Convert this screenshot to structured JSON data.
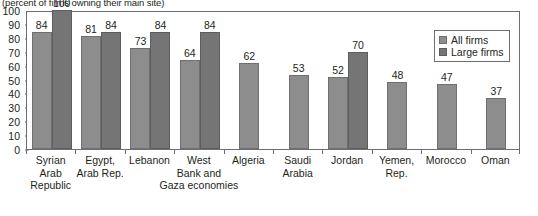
{
  "subtitle": "(percent of firms owning their main site)",
  "legend": {
    "position": "top-right",
    "entries": [
      {
        "label": "All firms",
        "color": "#8d8d8d"
      },
      {
        "label": "Large firms",
        "color": "#757575"
      }
    ]
  },
  "yaxis": {
    "ticks": [
      "0",
      "10",
      "20",
      "30",
      "40",
      "50",
      "60",
      "70",
      "80",
      "90",
      "100"
    ]
  },
  "categories": [
    {
      "lines": [
        "Syrian",
        "Arab",
        "Republic"
      ]
    },
    {
      "lines": [
        "Egypt,",
        "Arab Rep."
      ]
    },
    {
      "lines": [
        "Lebanon"
      ]
    },
    {
      "lines": [
        "West",
        "Bank and",
        "Gaza economies"
      ]
    },
    {
      "lines": [
        "Algeria"
      ]
    },
    {
      "lines": [
        "Saudi",
        "Arabia"
      ]
    },
    {
      "lines": [
        "Jordan"
      ]
    },
    {
      "lines": [
        "Yemen,",
        "Rep."
      ]
    },
    {
      "lines": [
        "Morocco"
      ]
    },
    {
      "lines": [
        "Oman"
      ]
    }
  ],
  "chart_data": {
    "type": "bar",
    "title": "",
    "subtitle": "(percent of firms owning their main site)",
    "xlabel": "",
    "ylabel": "",
    "ylim": [
      0,
      100
    ],
    "ytick_step": 10,
    "grid": false,
    "legend_position": "top-right",
    "categories": [
      "Syrian Arab Republic",
      "Egypt, Arab Rep.",
      "Lebanon",
      "West Bank and Gaza economies",
      "Algeria",
      "Saudi Arabia",
      "Jordan",
      "Yemen, Rep.",
      "Morocco",
      "Oman"
    ],
    "series": [
      {
        "name": "All firms",
        "color": "#8d8d8d",
        "values": [
          84,
          81,
          73,
          64,
          62,
          53,
          52,
          48,
          47,
          37
        ]
      },
      {
        "name": "Large firms",
        "color": "#757575",
        "values": [
          100,
          84,
          84,
          84,
          null,
          null,
          70,
          null,
          null,
          null
        ]
      }
    ]
  }
}
